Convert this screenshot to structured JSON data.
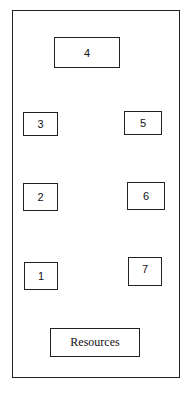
{
  "diagram": {
    "stations": [
      {
        "id": "4",
        "label": "4",
        "x": 54,
        "y": 37,
        "w": 66,
        "h": 31
      },
      {
        "id": "3",
        "label": "3",
        "x": 23,
        "y": 112,
        "w": 35,
        "h": 24
      },
      {
        "id": "5",
        "label": "5",
        "x": 124,
        "y": 111,
        "w": 38,
        "h": 24
      },
      {
        "id": "2",
        "label": "2",
        "x": 23,
        "y": 183,
        "w": 35,
        "h": 28
      },
      {
        "id": "6",
        "label": "6",
        "x": 127,
        "y": 182,
        "w": 38,
        "h": 28
      },
      {
        "id": "1",
        "label": "1",
        "x": 24,
        "y": 262,
        "w": 34,
        "h": 28
      },
      {
        "id": "7",
        "label": "7",
        "x": 128,
        "y": 257,
        "w": 34,
        "h": 29
      }
    ],
    "resources": {
      "label": "Resources",
      "x": 50,
      "y": 328,
      "w": 90,
      "h": 29
    }
  }
}
